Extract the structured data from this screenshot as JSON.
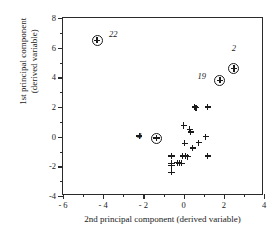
{
  "chart_data": {
    "type": "scatter",
    "title": "",
    "xlabel": "2nd principal component (derived variable)",
    "ylabel_line1": "1st principal component",
    "ylabel_line2": "(derived variable)",
    "xlim": [
      -6,
      4
    ],
    "ylim": [
      -4,
      8
    ],
    "xticks": [
      -6,
      -4,
      -2,
      0,
      2,
      4
    ],
    "xticklabels": [
      "- 6",
      "- 4",
      "- 2",
      "0",
      "2",
      "4"
    ],
    "xminorticks": [
      -5,
      -3,
      -1,
      1,
      3
    ],
    "yticks": [
      -4,
      -2,
      0,
      2,
      4,
      6,
      8
    ],
    "yticklabels": [
      "-4",
      "-2",
      "0",
      "2",
      "4",
      "6",
      "8"
    ],
    "yminorticks": [
      -3,
      -1,
      1,
      3,
      5,
      7
    ],
    "grid": false,
    "legend": "none",
    "marker": "plus",
    "highlight_marker": "circled-plus",
    "series": [
      {
        "name": "highlighted observations",
        "marker": "circled-plus",
        "points": [
          {
            "x": -4.3,
            "y": 6.5,
            "label": "22",
            "label_x": -3.5,
            "label_y": 6.9
          },
          {
            "x": 2.5,
            "y": 4.6,
            "label": "2",
            "label_x": 2.5,
            "label_y": 6.0
          },
          {
            "x": 1.8,
            "y": 3.8,
            "label": "19",
            "label_x": 0.9,
            "label_y": 4.1
          },
          {
            "x": -1.35,
            "y": -0.1,
            "label": "4",
            "label_x": -2.2,
            "label_y": 0.05
          }
        ]
      },
      {
        "name": "observations",
        "marker": "plus",
        "points": [
          {
            "x": 0.55,
            "y": 2.0
          },
          {
            "x": 0.62,
            "y": 1.95
          },
          {
            "x": 1.2,
            "y": 2.0
          },
          {
            "x": 0.0,
            "y": 0.75
          },
          {
            "x": 0.3,
            "y": 0.5
          },
          {
            "x": 0.35,
            "y": 0.3
          },
          {
            "x": -2.2,
            "y": 0.05
          },
          {
            "x": 1.1,
            "y": 0.0
          },
          {
            "x": 0.05,
            "y": -0.45
          },
          {
            "x": 0.75,
            "y": -0.4
          },
          {
            "x": 0.45,
            "y": -0.75
          },
          {
            "x": -0.6,
            "y": -1.3
          },
          {
            "x": -0.05,
            "y": -1.3
          },
          {
            "x": 0.1,
            "y": -1.3
          },
          {
            "x": 0.2,
            "y": -1.35
          },
          {
            "x": 1.2,
            "y": -1.3
          },
          {
            "x": -0.6,
            "y": -1.8
          },
          {
            "x": -0.6,
            "y": -1.95
          },
          {
            "x": -0.3,
            "y": -1.75
          },
          {
            "x": -0.2,
            "y": -1.8
          },
          {
            "x": -0.1,
            "y": -1.8
          },
          {
            "x": -0.6,
            "y": -2.4
          }
        ]
      }
    ]
  }
}
